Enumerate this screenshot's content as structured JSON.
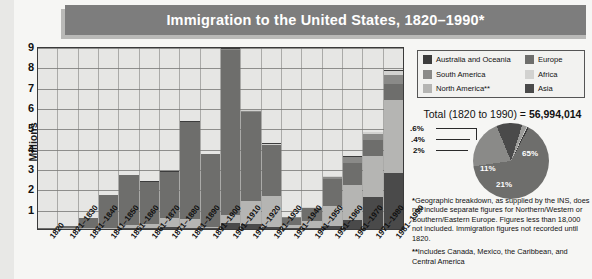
{
  "title": "Immigration to the United States, 1820–1990*",
  "axis": {
    "ylabel": "Millions",
    "yticks": [
      "9",
      "8",
      "7",
      "6",
      "5",
      "4",
      "3",
      "2",
      "1"
    ]
  },
  "legend": {
    "left": [
      {
        "label": "Australia and Oceania",
        "color": "#3c3c3c"
      },
      {
        "label": "South America",
        "color": "#8a8a88"
      },
      {
        "label": "North America**",
        "color": "#b5b5b3"
      }
    ],
    "right": [
      {
        "label": "Europe",
        "color": "#6e6e6c"
      },
      {
        "label": "Africa",
        "color": "#d2d2d0"
      },
      {
        "label": "Asia",
        "color": "#4a4a4a"
      }
    ]
  },
  "total": {
    "prefix": "Total (1820 to 1990) = ",
    "value": "56,994,014"
  },
  "notes": {
    "one_marker": "*",
    "one": "Geographic breakdown, as supplied by the INS, does not include separate figures for Northern/Western or Southern/Eastern Europe. Figures less than 18,000 not included. Immigration figures not recorded until 1820.",
    "two_marker": "**",
    "two": "Includes Canada, Mexico, the Caribbean, and Central America"
  },
  "chart_data": [
    {
      "type": "bar",
      "title": "Immigration to the United States, 1820–1990*",
      "xlabel": "",
      "ylabel": "Millions",
      "ylim": [
        0,
        9
      ],
      "grid": true,
      "stacked": true,
      "legend_position": "top-right",
      "categories": [
        "1820",
        "1821–1830",
        "1831–1840",
        "1841–1850",
        "1851–1860",
        "1861–1870",
        "1871–1880",
        "1881–1890",
        "1891–1900",
        "1901–1910",
        "1911–1920",
        "1921–1930",
        "1931–1940",
        "1941–1950",
        "1951–1960",
        "1961–1970",
        "1971–1980",
        "1981–1990"
      ],
      "series": [
        {
          "name": "Europe",
          "color": "#6e6e6c",
          "values": [
            0.008,
            0.1,
            0.5,
            1.6,
            2.45,
            2.07,
            2.27,
            4.74,
            3.56,
            8.14,
            4.38,
            2.48,
            0.35,
            0.62,
            1.33,
            1.12,
            0.8,
            0.76
          ]
        },
        {
          "name": "Asia",
          "color": "#4a4a4a",
          "values": [
            0.0,
            0.0,
            0.0,
            0.0,
            0.04,
            0.06,
            0.12,
            0.07,
            0.07,
            0.32,
            0.25,
            0.11,
            0.02,
            0.04,
            0.15,
            0.43,
            1.59,
            2.74
          ]
        },
        {
          "name": "North America**",
          "color": "#b5b5b3",
          "values": [
            0.0,
            0.01,
            0.01,
            0.06,
            0.15,
            0.17,
            0.4,
            0.43,
            0.04,
            0.36,
            1.14,
            1.52,
            0.16,
            0.35,
            1.0,
            1.72,
            1.98,
            3.62
          ]
        },
        {
          "name": "South America",
          "color": "#8a8a88",
          "values": [
            0.0,
            0.0,
            0.0,
            0.0,
            0.0,
            0.01,
            0.01,
            0.01,
            0.0,
            0.02,
            0.04,
            0.04,
            0.01,
            0.02,
            0.08,
            0.26,
            0.3,
            0.46
          ]
        },
        {
          "name": "Africa",
          "color": "#d2d2d0",
          "values": [
            0.0,
            0.0,
            0.0,
            0.0,
            0.0,
            0.0,
            0.0,
            0.0,
            0.0,
            0.01,
            0.01,
            0.01,
            0.0,
            0.01,
            0.01,
            0.03,
            0.08,
            0.18
          ]
        },
        {
          "name": "Australia and Oceania",
          "color": "#3c3c3c",
          "values": [
            0.0,
            0.0,
            0.0,
            0.0,
            0.0,
            0.01,
            0.01,
            0.01,
            0.0,
            0.01,
            0.01,
            0.01,
            0.0,
            0.01,
            0.01,
            0.03,
            0.04,
            0.04
          ]
        }
      ]
    },
    {
      "type": "pie",
      "title": "Total (1820 to 1990) = 56,994,014",
      "labels": [
        "Europe",
        "North America**",
        "Asia",
        "South America",
        "Africa",
        "Australia and Oceania"
      ],
      "display_labels": [
        "65%",
        "21%",
        "11%",
        "2%",
        ".4%",
        ".6%"
      ],
      "values": [
        65,
        21,
        11,
        2,
        0.4,
        0.6
      ],
      "colors": [
        "#6e6e6c",
        "#8a8a88",
        "#4a4a4a",
        "#9c9c9a",
        "#c6c6c4",
        "#3c3c3c"
      ]
    }
  ]
}
